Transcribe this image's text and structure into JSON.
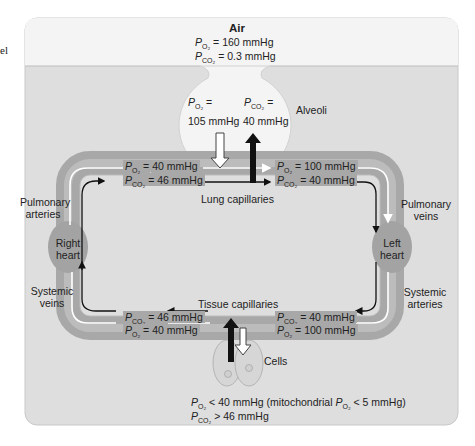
{
  "margin_text": "el",
  "air": {
    "title": "Air",
    "po2": "= 160 mmHg",
    "pco2": "= 0.3 mmHg"
  },
  "alveoli": {
    "label": "Alveoli",
    "po2_label": "=",
    "po2_value": "105 mmHg",
    "pco2_label": "=",
    "pco2_value": "40 mmHg"
  },
  "symbols": {
    "P": "P",
    "O2": "O₂",
    "CO2": "CO₂"
  },
  "lung_capillaries": {
    "label": "Lung capillaries",
    "left_po2": "= 40 mmHg",
    "left_pco2": "= 46 mmHg",
    "right_po2": "= 100 mmHg",
    "right_pco2": "= 40 mmHg"
  },
  "tissue_capillaries": {
    "label": "Tissue capillaries",
    "left_pco2": "= 46 mmHg",
    "left_po2": "= 40 mmHg",
    "right_pco2": "= 40 mmHg",
    "right_po2": "= 100 mmHg"
  },
  "vessels": {
    "pulmonary_arteries": [
      "Pulmonary",
      "arteries"
    ],
    "pulmonary_veins": [
      "Pulmonary",
      "veins"
    ],
    "systemic_veins": [
      "Systemic",
      "veins"
    ],
    "systemic_arteries": [
      "Systemic",
      "arteries"
    ]
  },
  "hearts": {
    "right": [
      "Right",
      "heart"
    ],
    "left": [
      "Left",
      "heart"
    ]
  },
  "cells": {
    "label": "Cells",
    "po2_text": "< 40 mmHg (mitochondrial ",
    "po2_mito": "< 5 mmHg)",
    "pco2_text": "> 46 mmHg"
  },
  "colors": {
    "air_bg": "#f4f4f4",
    "body_bg": "#dedede",
    "vessel": "#a8a8a8",
    "heart": "#a3a3a3",
    "alveolus": "#f4f4f4",
    "cell": "#d6d6d6"
  }
}
